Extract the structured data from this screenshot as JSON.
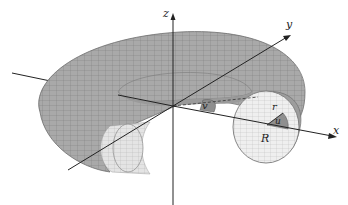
{
  "figure": {
    "axes": {
      "x_label": "x",
      "y_label": "y",
      "z_label": "z"
    },
    "parameters": {
      "major_radius_label": "R",
      "minor_radius_label": "r",
      "tube_angle_label": "u",
      "revolution_angle_label": "v"
    },
    "colors": {
      "surface": "#a9a9a9",
      "surface_light": "#d8d8d8",
      "inner_section": "#ececec",
      "mesh": "#7d7d7d",
      "axis": "#222222",
      "angle_fill": "#8f8f8f"
    }
  }
}
